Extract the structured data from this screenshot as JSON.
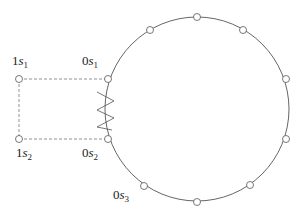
{
  "diagram": {
    "labels": {
      "s1_1": {
        "prefix": "1",
        "var": "s",
        "sub": "1"
      },
      "s1_0": {
        "prefix": "0",
        "var": "s",
        "sub": "1"
      },
      "s2_1": {
        "prefix": "1",
        "var": "s",
        "sub": "2"
      },
      "s2_0": {
        "prefix": "0",
        "var": "s",
        "sub": "2"
      },
      "s3_0": {
        "prefix": "0",
        "var": "s",
        "sub": "3"
      }
    },
    "circle": {
      "cx": 197,
      "cy": 109,
      "r": 92,
      "node_count": 12
    },
    "colors": {
      "stroke": "#555555",
      "dash": "#777777"
    }
  }
}
